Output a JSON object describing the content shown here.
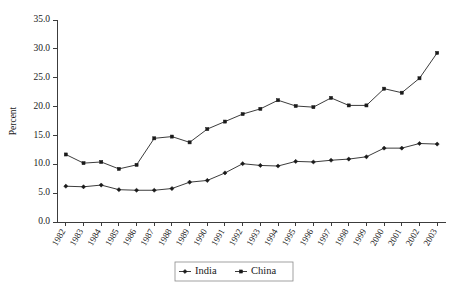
{
  "chart_data": {
    "type": "line",
    "title": "",
    "xlabel": "",
    "ylabel": "Percent",
    "ylim": [
      0.0,
      35.0
    ],
    "ytick_step": 5.0,
    "grid": false,
    "legend_position": "bottom-center",
    "categories": [
      "1982",
      "1983",
      "1984",
      "1985",
      "1986",
      "1987",
      "1988",
      "1989",
      "1990",
      "1991",
      "1992",
      "1993",
      "1994",
      "1995",
      "1996",
      "1997",
      "1998",
      "1999",
      "2000",
      "2001",
      "2002",
      "2003"
    ],
    "ytick_labels": [
      "0.0",
      "5.0",
      "10.0",
      "15.0",
      "20.0",
      "25.0",
      "30.0",
      "35.0"
    ],
    "series": [
      {
        "name": "India",
        "marker": "diamond",
        "color": "#1a1a1a",
        "values": [
          6.2,
          6.1,
          6.4,
          5.6,
          5.5,
          5.5,
          5.8,
          6.9,
          7.2,
          8.5,
          10.1,
          9.8,
          9.7,
          10.5,
          10.4,
          10.7,
          10.9,
          11.3,
          12.8,
          12.8,
          13.6,
          13.5
        ]
      },
      {
        "name": "China",
        "marker": "square",
        "color": "#1a1a1a",
        "values": [
          11.7,
          10.2,
          10.4,
          9.2,
          9.9,
          14.5,
          14.8,
          13.8,
          16.1,
          17.4,
          18.7,
          19.6,
          21.1,
          20.1,
          19.9,
          21.5,
          20.2,
          20.2,
          23.1,
          22.4,
          24.9,
          29.3
        ]
      }
    ]
  },
  "legend": {
    "items": [
      {
        "label": "India",
        "marker": "diamond"
      },
      {
        "label": "China",
        "marker": "square"
      }
    ]
  },
  "axes": {
    "y_axis_title": "Percent"
  }
}
